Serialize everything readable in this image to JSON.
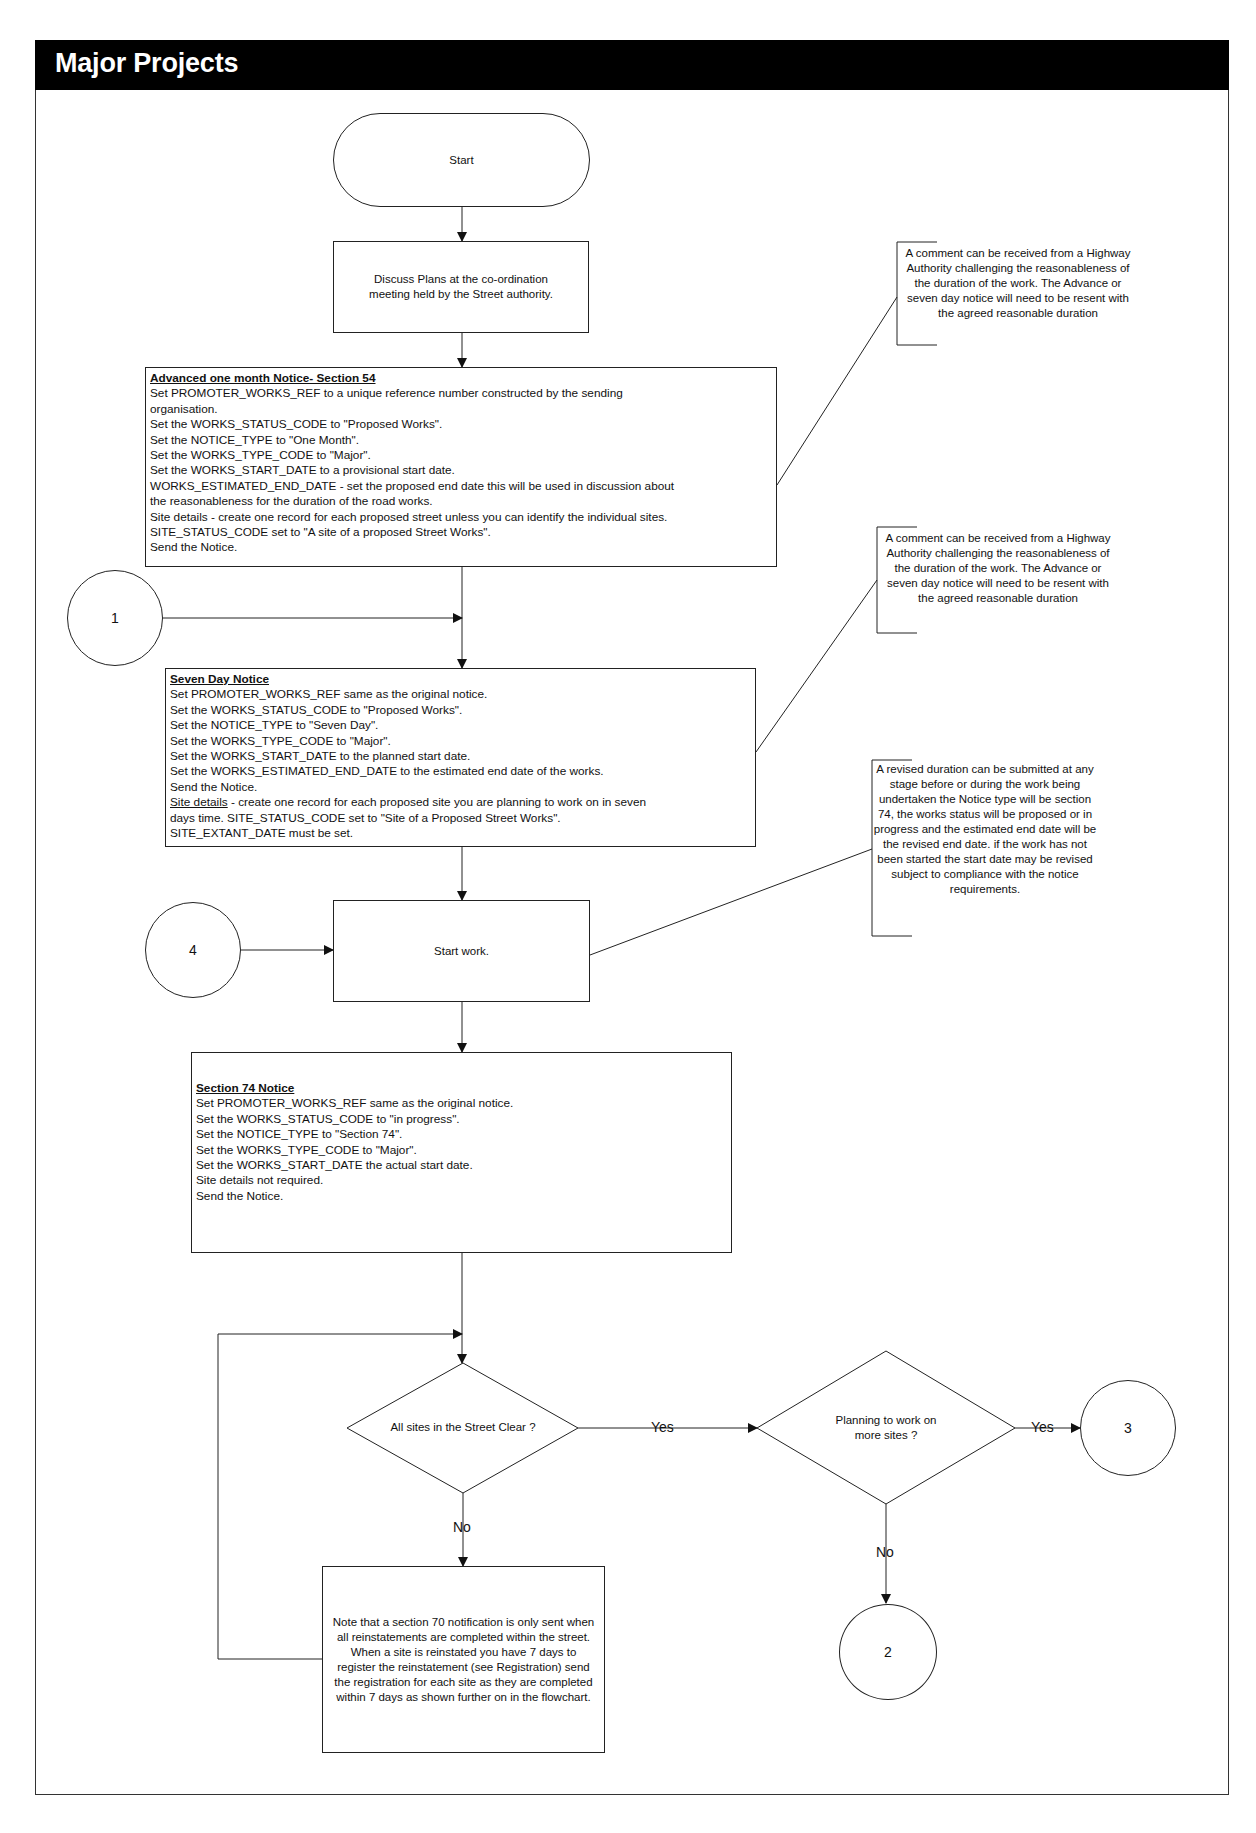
{
  "header": {
    "title": "Major Projects"
  },
  "nodes": {
    "start": {
      "label": "Start"
    },
    "discuss": {
      "label": "Discuss Plans at the co-ordination meeting held by the Street authority."
    },
    "advanced_notice": {
      "heading": "Advanced one month Notice- Section 54",
      "lines": [
        "Set PROMOTER_WORKS_REF to a unique reference number constructed by the sending",
        "organisation.",
        "Set the WORKS_STATUS_CODE to \"Proposed Works\".",
        "Set the NOTICE_TYPE to \"One Month\".",
        "Set the WORKS_TYPE_CODE to \"Major\".",
        "Set the WORKS_START_DATE to a provisional start date.",
        "WORKS_ESTIMATED_END_DATE - set the proposed end date this will be used in discussion about",
        "the reasonableness for the duration of the road works.",
        "Site details - create one record for each proposed street unless you can identify the individual sites.",
        "SITE_STATUS_CODE set to \"A site of a proposed Street Works\".",
        "Send the Notice."
      ]
    },
    "seven_day_notice": {
      "heading": "Seven Day Notice",
      "lines": [
        "Set PROMOTER_WORKS_REF same as the original notice.",
        "Set the WORKS_STATUS_CODE to \"Proposed Works\".",
        "Set the NOTICE_TYPE to \"Seven Day\".",
        "Set the WORKS_TYPE_CODE to \"Major\".",
        "Set the WORKS_START_DATE to the planned start date.",
        "Set the WORKS_ESTIMATED_END_DATE to the estimated end date of the works.",
        "Send the Notice."
      ],
      "site_details_link": "Site details",
      "site_details_rest": " - create one record for each proposed site you are planning to work on in seven",
      "lines_after": [
        "days time. SITE_STATUS_CODE set to \"Site of a Proposed Street Works\".",
        "SITE_EXTANT_DATE must be set."
      ]
    },
    "start_work": {
      "label": "Start work."
    },
    "section74_notice": {
      "heading": "Section 74 Notice",
      "lines": [
        "Set PROMOTER_WORKS_REF same as the original notice.",
        "Set the WORKS_STATUS_CODE to \"in progress\".",
        "Set the NOTICE_TYPE to \"Section 74\".",
        "Set the WORKS_TYPE_CODE to \"Major\".",
        "Set the WORKS_START_DATE the actual start date.",
        "Site details not required.",
        "Send the Notice."
      ]
    },
    "decision_all_clear": {
      "label": "All sites in the Street Clear ?"
    },
    "decision_more_sites": {
      "label_line1": "Planning to work on",
      "label_line2": "more sites ?"
    },
    "note_section70": {
      "label": "Note that a section 70 notification is only sent when all reinstatements are completed within the street.  When a site is reinstated you have 7 days to register the reinstatement (see Registration) send the registration for each site as they are completed within 7 days as shown further on in the flowchart."
    }
  },
  "connectors": {
    "circle_1": "1",
    "circle_2": "2",
    "circle_3": "3",
    "circle_4": "4"
  },
  "edge_labels": {
    "all_clear_yes": "Yes",
    "all_clear_no": "No",
    "more_sites_yes": "Yes",
    "more_sites_no": "No"
  },
  "comments": {
    "comment_advanced": "A comment can be received from a Highway Authority challenging the reasonableness of the duration of the work. The Advance or seven day notice will need to be resent with the agreed reasonable duration",
    "comment_seven_day": "A comment can be received from a Highway Authority challenging the reasonableness of the duration of the work. The Advance or seven day notice will need to be resent with the agreed reasonable duration",
    "comment_revised_duration": "A revised duration can be submitted at any stage before or during the work being undertaken the Notice type will be section 74, the works status will be proposed or in progress and the estimated end date will be the revised end date.  if the work has not been started the start date may be revised subject to compliance with the notice requirements."
  },
  "colors": {
    "header_bg": "#000000",
    "header_text": "#ffffff",
    "line": "#222222"
  }
}
